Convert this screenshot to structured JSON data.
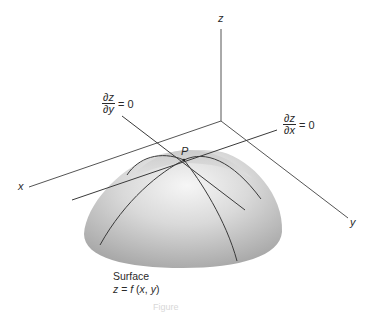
{
  "figure": {
    "axes": {
      "x_label": "x",
      "y_label": "y",
      "z_label": "z"
    },
    "point_label": "P",
    "tangent_y": {
      "numerator_partial": "∂",
      "numerator_var": "z",
      "denominator_partial": "∂",
      "denominator_var": "y",
      "equals": "= 0"
    },
    "tangent_x": {
      "numerator_partial": "∂",
      "numerator_var": "z",
      "denominator_partial": "∂",
      "denominator_var": "x",
      "equals": "= 0"
    },
    "surface_caption": {
      "line1": "Surface",
      "z": "z",
      "eq": " = ",
      "f": "f",
      "args_open": " (",
      "x": "x",
      "comma": ", ",
      "y": "y",
      "args_close": ")"
    },
    "figure_caption": "Figure",
    "colors": {
      "line": "#3a3a3a",
      "axis": "#555555",
      "surface_light": "#f4f4f4",
      "surface_dark": "#a8a8a8",
      "background": "#ffffff"
    }
  }
}
